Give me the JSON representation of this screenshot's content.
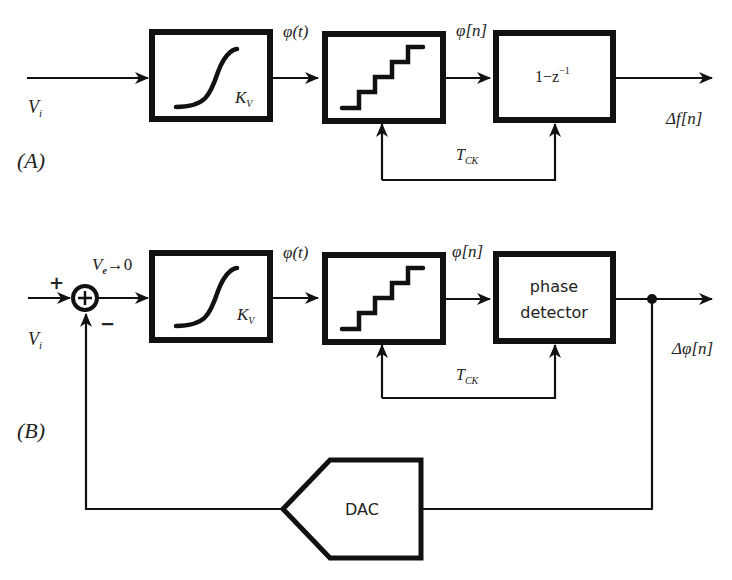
{
  "diagram": {
    "panel_a": {
      "label": "(A)",
      "input_label": "V",
      "input_sub": "i",
      "vco_gain": "K",
      "vco_gain_sub": "V",
      "vco_output": "φ(t)",
      "sampler_output": "φ[n]",
      "diff_block": "1−z",
      "diff_block_exp": "−1",
      "clock_label": "T",
      "clock_sub": "CK",
      "output_label": "Δf[n]"
    },
    "panel_b": {
      "label": "(B)",
      "plus_sign": "+",
      "minus_sign": "−",
      "error_label": "V",
      "error_sub": "e",
      "error_arrow": "→0",
      "input_label": "V",
      "input_sub": "i",
      "vco_gain": "K",
      "vco_gain_sub": "V",
      "vco_output": "φ(t)",
      "sampler_output": "φ[n]",
      "pd_line1": "phase",
      "pd_line2": "detector",
      "clock_label": "T",
      "clock_sub": "CK",
      "output_label": "Δφ[n]",
      "dac_label": "DAC"
    }
  }
}
